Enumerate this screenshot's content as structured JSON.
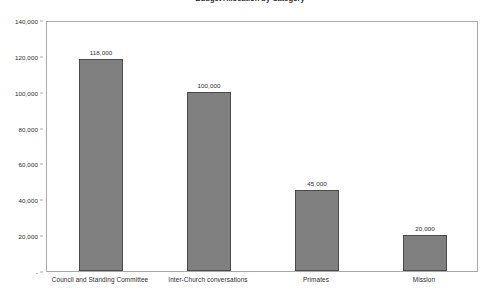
{
  "chart_data": {
    "type": "bar",
    "title": "Budget Allocation by Category",
    "subtitle": "",
    "xlabel": "",
    "ylabel": "",
    "categories": [
      "Council and Standing Committee",
      "Inter-Church conversations",
      "Primates",
      "Mission"
    ],
    "values": [
      118000,
      100000,
      45000,
      20000
    ],
    "value_labels": [
      "118,000",
      "100,000",
      "45,000",
      "20,000"
    ],
    "ylim": [
      0,
      140000
    ],
    "ytick_values": [
      0,
      20000,
      40000,
      60000,
      80000,
      100000,
      120000,
      140000
    ],
    "ytick_labels": [
      "-",
      "20,000",
      "40,000",
      "60,000",
      "80,000",
      "100,000",
      "120,000",
      "140,000"
    ],
    "grid": false,
    "legend": false,
    "legend_position": "none",
    "bar_color": "#808080",
    "bar_border_color": "#4a4a4a",
    "frame_color": "#a9a9a9",
    "background": "#ffffff",
    "text_color": "#2b2b2b"
  }
}
